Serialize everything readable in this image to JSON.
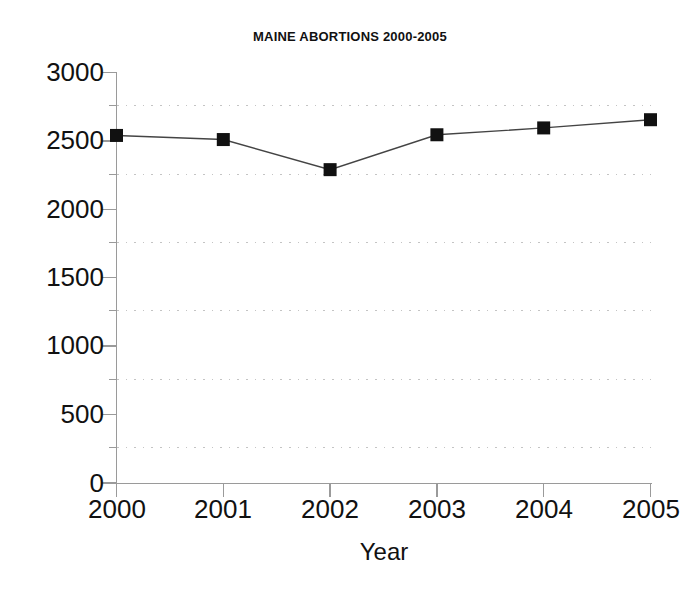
{
  "chart_data": {
    "type": "line",
    "title": "MAINE ABORTIONS 2000-2005",
    "xlabel": "Year",
    "ylabel": "",
    "categories": [
      "2000",
      "2001",
      "2002",
      "2003",
      "2004",
      "2005"
    ],
    "x": [
      2000,
      2001,
      2002,
      2003,
      2004,
      2005
    ],
    "values": [
      2540,
      2510,
      2290,
      2545,
      2595,
      2655
    ],
    "series": [
      {
        "name": "Maine abortions",
        "values": [
          2540,
          2510,
          2290,
          2545,
          2595,
          2655
        ]
      }
    ],
    "ylim": [
      0,
      3000
    ],
    "xlim": [
      2000,
      2005
    ],
    "y_ticks": [
      0,
      500,
      1000,
      1500,
      2000,
      2500,
      3000
    ],
    "y_tick_labels": [
      "0",
      "500",
      "1000",
      "1500",
      "2000",
      "2500",
      "3000"
    ],
    "y_minor_ticks": [
      250,
      750,
      1250,
      1750,
      2250,
      2750
    ],
    "x_ticks": [
      2000,
      2001,
      2002,
      2003,
      2004,
      2005
    ],
    "x_tick_labels": [
      "2000",
      "2001",
      "2002",
      "2003",
      "2004",
      "2005"
    ],
    "grid": {
      "horizontal_dotted_at": [
        250,
        750,
        1250,
        1750,
        2250,
        2750
      ],
      "vertical": false
    },
    "legend": {
      "visible": false,
      "position": "none",
      "entries": []
    },
    "annotations": [],
    "style": {
      "line_color": "#444444",
      "marker_color": "#111111",
      "marker_shape": "square",
      "axis_color": "#8a8a8a",
      "grid_color": "#c9c9c9",
      "background": "#ffffff",
      "text_color": "#111111"
    }
  }
}
